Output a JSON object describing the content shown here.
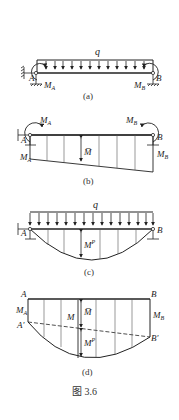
{
  "figure": {
    "caption": "图 3.6",
    "panels": {
      "a": {
        "label": "(a)",
        "load_label": "q",
        "left_node": "A",
        "right_node": "B",
        "left_moment": "M",
        "left_moment_sub": "A",
        "right_moment": "M",
        "right_moment_sub": "B"
      },
      "b": {
        "label": "(b)",
        "left_node": "A",
        "right_node": "B",
        "left_moment": "M",
        "left_moment_sub": "A",
        "right_moment": "M",
        "right_moment_sub": "B",
        "left_ordinate": "M",
        "left_ordinate_sub": "A",
        "right_ordinate": "M",
        "right_ordinate_sub": "B",
        "middle_label": "M̅"
      },
      "c": {
        "label": "(c)",
        "load_label": "q",
        "left_node": "A",
        "right_node": "B",
        "middle_label": "M",
        "middle_label_sup": "P"
      },
      "d": {
        "label": "(d)",
        "top_left": "A",
        "top_right": "B",
        "left_ordinate": "M",
        "left_ordinate_sub": "A",
        "right_ordinate": "M",
        "right_ordinate_sub": "B",
        "lower_left": "A′",
        "lower_right": "B′",
        "total_label": "M",
        "upper_part_label": "M̅",
        "lower_part_label": "M",
        "lower_part_sup": "P"
      }
    }
  },
  "colors": {
    "line": "#222222",
    "thin_line": "#555555",
    "background": "#ffffff"
  }
}
